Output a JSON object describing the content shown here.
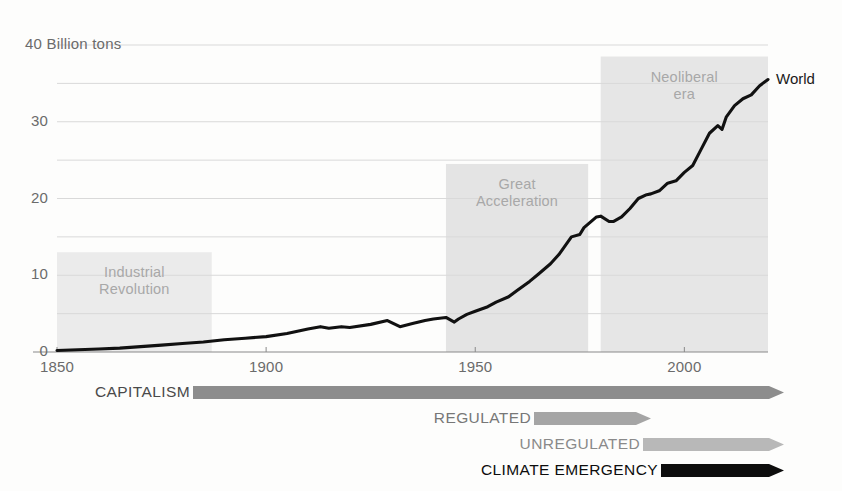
{
  "chart_data": {
    "type": "line",
    "title": "",
    "subtitle": "",
    "xlabel": "",
    "ylabel": "",
    "unit_label": "40 Billion tons",
    "yunit": "Billion tons",
    "xlim": [
      1850,
      2020
    ],
    "ylim": [
      0,
      40
    ],
    "grid": true,
    "grid_major_step": 10,
    "grid_minor_step": 5,
    "xticks": [
      "1850",
      "1900",
      "1950",
      "2000"
    ],
    "xtick_values": [
      1850,
      1900,
      1950,
      2000
    ],
    "yticks": [
      "0",
      "10",
      "20",
      "30",
      "40"
    ],
    "ytick_values": [
      0,
      10,
      20,
      30,
      40
    ],
    "legend_position": "end-of-line",
    "series": [
      {
        "name": "World",
        "color": "#111111",
        "x": [
          1850,
          1855,
          1860,
          1865,
          1870,
          1875,
          1880,
          1885,
          1890,
          1895,
          1900,
          1905,
          1910,
          1913,
          1915,
          1918,
          1920,
          1925,
          1929,
          1932,
          1935,
          1938,
          1940,
          1943,
          1945,
          1946,
          1948,
          1950,
          1953,
          1955,
          1958,
          1960,
          1963,
          1965,
          1968,
          1970,
          1973,
          1975,
          1976,
          1979,
          1980,
          1982,
          1983,
          1985,
          1987,
          1989,
          1991,
          1992,
          1994,
          1996,
          1998,
          2000,
          2002,
          2004,
          2006,
          2008,
          2009,
          2010,
          2012,
          2014,
          2016,
          2018,
          2020
        ],
        "values": [
          0.2,
          0.3,
          0.4,
          0.5,
          0.7,
          0.9,
          1.1,
          1.3,
          1.6,
          1.8,
          2.0,
          2.4,
          3.0,
          3.3,
          3.1,
          3.3,
          3.2,
          3.6,
          4.1,
          3.3,
          3.7,
          4.1,
          4.3,
          4.5,
          3.9,
          4.3,
          4.9,
          5.3,
          5.9,
          6.5,
          7.2,
          8.0,
          9.2,
          10.1,
          11.5,
          12.7,
          15.0,
          15.3,
          16.2,
          17.6,
          17.7,
          17.0,
          17.0,
          17.6,
          18.7,
          20.0,
          20.5,
          20.6,
          21.0,
          22.0,
          22.3,
          23.4,
          24.3,
          26.4,
          28.5,
          29.5,
          29.0,
          30.6,
          32.1,
          33.0,
          33.5,
          34.7,
          35.5
        ]
      }
    ],
    "bands": [
      {
        "label": "Industrial\nRevolution",
        "x0": 1850,
        "x1": 1887,
        "y0": 0,
        "y1": 13,
        "color": "#ebebeb"
      },
      {
        "label": "Great\nAcceleration",
        "x0": 1943,
        "x1": 1977,
        "y0": 0,
        "y1": 24.5,
        "color": "#e4e4e4"
      },
      {
        "label": "Neoliberal\nera",
        "x0": 1980,
        "x1": 2022,
        "y0": 0,
        "y1": 38.5,
        "color": "#e6e6e6"
      }
    ]
  },
  "timeline": {
    "rows": [
      {
        "label": "CAPITALISM",
        "color": "#8d8d8d",
        "text_color": "#4a4a4a",
        "bar_start": 187,
        "bar_end": 778,
        "row_top": 10
      },
      {
        "label": "REGULATED",
        "color": "#a5a5a5",
        "text_color": "#777777",
        "bar_start": 528,
        "bar_end": 645,
        "row_top": 36
      },
      {
        "label": "UNREGULATED",
        "color": "#b8b8b8",
        "text_color": "#8a8a8a",
        "bar_start": 637,
        "bar_end": 778,
        "row_top": 62
      },
      {
        "label": "CLIMATE EMERGENCY",
        "color": "#0d0d0d",
        "text_color": "#0d0d0d",
        "bar_start": 655,
        "bar_end": 778,
        "row_top": 88
      }
    ]
  },
  "colors": {
    "line": "#111111",
    "grid": "#d9d9d9",
    "axis": "#8a8a8a",
    "band": "#e6e6e6",
    "tick_text": "#6b6b6b",
    "band_text": "#a8a8a8",
    "background": "#fdfdfc"
  }
}
